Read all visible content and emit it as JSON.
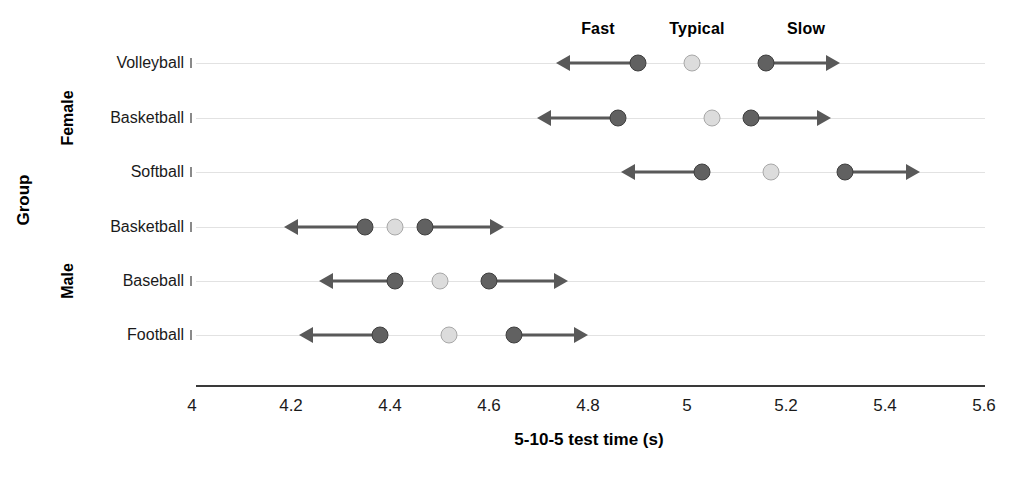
{
  "chart_data": {
    "type": "scatter",
    "title": "",
    "xlabel": "5-10-5 test time (s)",
    "ylabel": "Group",
    "xlim": [
      4,
      5.6
    ],
    "xticks": [
      4,
      4.2,
      4.4,
      4.6,
      4.8,
      5,
      5.2,
      5.4,
      5.6
    ],
    "xtick_labels": [
      "4",
      "4.2",
      "4.4",
      "4.6",
      "4.8",
      "5",
      "5.2",
      "5.4",
      "5.6"
    ],
    "grid": true,
    "legend_position": "top",
    "column_headers": [
      "Fast",
      "Typical",
      "Slow"
    ],
    "series": [
      {
        "name": "Fast",
        "marker": "dark-circle"
      },
      {
        "name": "Typical",
        "marker": "light-circle"
      },
      {
        "name": "Slow",
        "marker": "dark-circle"
      }
    ],
    "groups": [
      {
        "name": "Female",
        "categories": [
          "Volleyball",
          "Basketball",
          "Softball"
        ]
      },
      {
        "name": "Male",
        "categories": [
          "Basketball",
          "Baseball",
          "Football"
        ]
      }
    ],
    "categories": [
      "Volleyball",
      "Basketball",
      "Softball",
      "Basketball",
      "Baseball",
      "Football"
    ],
    "rows": [
      {
        "group": "Female",
        "category": "Volleyball",
        "fast": 4.9,
        "typical": 5.01,
        "slow": 5.16,
        "fast_extent": 4.74,
        "slow_extent": 5.31
      },
      {
        "group": "Female",
        "category": "Basketball",
        "fast": 4.86,
        "typical": 5.05,
        "slow": 5.13,
        "fast_extent": 4.7,
        "slow_extent": 5.29
      },
      {
        "group": "Female",
        "category": "Softball",
        "fast": 5.03,
        "typical": 5.17,
        "slow": 5.32,
        "fast_extent": 4.87,
        "slow_extent": 5.47
      },
      {
        "group": "Male",
        "category": "Basketball",
        "fast": 4.35,
        "typical": 4.41,
        "slow": 4.47,
        "fast_extent": 4.19,
        "slow_extent": 4.63
      },
      {
        "group": "Male",
        "category": "Baseball",
        "fast": 4.41,
        "typical": 4.5,
        "slow": 4.6,
        "fast_extent": 4.26,
        "slow_extent": 4.76
      },
      {
        "group": "Male",
        "category": "Football",
        "fast": 4.38,
        "typical": 4.52,
        "slow": 4.65,
        "fast_extent": 4.22,
        "slow_extent": 4.8
      }
    ],
    "colors": {
      "dark_marker": "#616161",
      "light_marker": "#dcdcdc",
      "line": "#595959",
      "grid": "#e2e2e2",
      "axis": "#3a3a3a"
    }
  }
}
